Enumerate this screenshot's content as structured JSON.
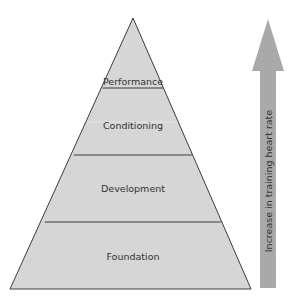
{
  "pyramid": {
    "levels": [
      {
        "label": "Performance"
      },
      {
        "label": "Conditioning"
      },
      {
        "label": "Development"
      },
      {
        "label": "Foundation"
      }
    ],
    "fill": "#d6d6d6",
    "stroke": "#3c3c3c"
  },
  "arrow": {
    "label": "Increase in training heart rate",
    "fill": "#a9a9a9"
  }
}
